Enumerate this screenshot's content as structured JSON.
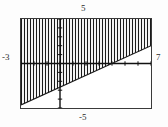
{
  "screen": {
    "kind": "graphing-calculator-viewport",
    "background_color": "#ffffff",
    "frame_color": "#3a3a3a"
  },
  "labels": {
    "y_max": "5",
    "y_min": "-5",
    "x_min": "-3",
    "x_max": "7"
  },
  "chart_data": {
    "type": "line",
    "title": "",
    "xlabel": "",
    "ylabel": "",
    "xlim": [
      -3,
      7
    ],
    "ylim": [
      -5,
      5
    ],
    "grid": false,
    "legend": false,
    "axes": {
      "x_axis_visible": true,
      "y_axis_visible": true,
      "x_axis_y_value": 0,
      "y_axis_x_value": 0,
      "tick_spacing_x": 1,
      "tick_spacing_y": 1,
      "x_ticks": [
        -3,
        -2,
        -1,
        0,
        1,
        2,
        3,
        4,
        5,
        6,
        7
      ],
      "y_ticks": [
        -5,
        -4,
        -3,
        -2,
        -1,
        0,
        1,
        2,
        3,
        4,
        5
      ],
      "tick_labels_shown": false
    },
    "series": [
      {
        "name": "boundary-line",
        "kind": "line",
        "style": "solid",
        "color": "#1a1a1a",
        "slope": 0.6667,
        "intercept": -2.6667,
        "equation": "y = (2/3)x - 8/3",
        "x": [
          -3,
          7
        ],
        "values": [
          -4.6667,
          2.0
        ]
      }
    ],
    "shaded_region": {
      "name": "inequality-shading",
      "relation": "y >= (2/3)x - 8/3",
      "direction": "above",
      "fill_style": "vertical-hatch",
      "hatch_spacing_px": 3,
      "color": "#1a1a1a"
    }
  }
}
